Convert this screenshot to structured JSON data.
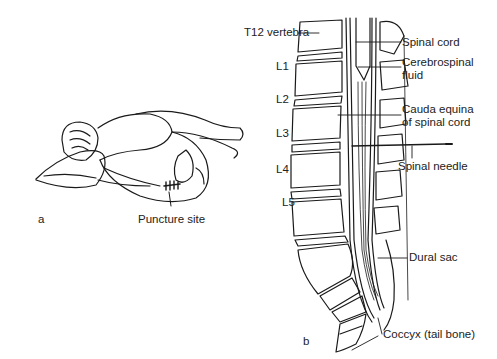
{
  "figure": {
    "panel_a": {
      "panel_label": "a",
      "caption_label": "Puncture site"
    },
    "panel_b": {
      "panel_label": "b",
      "vertebra_labels": [
        "L1",
        "L2",
        "L3",
        "L4",
        "L5"
      ],
      "left_labels": {
        "t12": "T12 vertebra"
      },
      "right_labels": {
        "spinal_cord": "Spinal cord",
        "csf_line1": "Cerebrospinal",
        "csf_line2": "fluid",
        "cauda_line1": "Cauda equina",
        "cauda_line2": "of spinal cord",
        "needle": "Spinal needle",
        "dural_sac": "Dural sac",
        "coccyx": "Coccyx (tail bone)"
      }
    }
  }
}
